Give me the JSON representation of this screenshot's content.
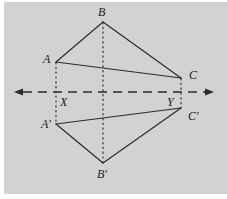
{
  "figure": {
    "background_color": "#d2d2d2",
    "page_color": "#ffffff",
    "stroke_color": "#2b2b2b",
    "panel": {
      "x": 4,
      "y": 2,
      "width": 223,
      "height": 192
    },
    "axis": {
      "name": "line-of-reflection",
      "style": "dashed",
      "y": 92,
      "x_start": 14,
      "x_end": 214,
      "arrow_left": true,
      "arrow_right": true,
      "dash_pattern": "9,6"
    },
    "points": [
      {
        "id": "B",
        "label": "B",
        "x": 103,
        "y": 22,
        "label_x": 98,
        "label_y": 6
      },
      {
        "id": "A",
        "label": "A",
        "x": 56,
        "y": 62,
        "label_x": 43,
        "label_y": 53
      },
      {
        "id": "C",
        "label": "C",
        "x": 181,
        "y": 78,
        "label_x": 189,
        "label_y": 69
      },
      {
        "id": "X",
        "label": "X",
        "x": 56,
        "y": 92,
        "label_x": 60,
        "label_y": 96
      },
      {
        "id": "Y",
        "label": "Y",
        "x": 181,
        "y": 92,
        "label_x": 167,
        "label_y": 96
      },
      {
        "id": "A'",
        "label": "A′",
        "x": 56,
        "y": 124,
        "label_x": 41,
        "label_y": 118
      },
      {
        "id": "C'",
        "label": "C′",
        "x": 181,
        "y": 108,
        "label_x": 188,
        "label_y": 110
      },
      {
        "id": "B'",
        "label": "B′",
        "x": 103,
        "y": 163,
        "label_x": 97,
        "label_y": 168
      }
    ],
    "solid_edges": [
      {
        "name": "edge-A-B",
        "from": "A",
        "to": "B"
      },
      {
        "name": "edge-B-C",
        "from": "B",
        "to": "C"
      },
      {
        "name": "edge-A-C",
        "from": "A",
        "to": "C"
      },
      {
        "name": "edge-Ap-Bp",
        "from": "A'",
        "to": "B'"
      },
      {
        "name": "edge-Bp-Cp",
        "from": "B'",
        "to": "C'"
      },
      {
        "name": "edge-Ap-Cp",
        "from": "A'",
        "to": "C'"
      }
    ],
    "dashed_connectors": [
      {
        "name": "connector-A-X-Aprime",
        "x": 56,
        "y_start": 62,
        "y_end": 124
      },
      {
        "name": "connector-B-Bprime",
        "x": 103,
        "y_start": 22,
        "y_end": 163
      },
      {
        "name": "connector-C-Y-Cprime",
        "x": 181,
        "y_start": 78,
        "y_end": 108
      }
    ]
  }
}
